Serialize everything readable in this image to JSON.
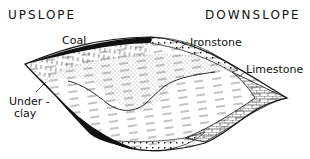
{
  "diagram": {
    "headings": {
      "upslope": "UPSLOPE",
      "downslope": "DOWNSLOPE"
    },
    "labels": {
      "coal": "Coal",
      "ironstone": "Ironstone",
      "limestone": "Limestone",
      "underclay_line1": "Under -",
      "underclay_line2": "clay"
    },
    "layers": [
      {
        "name": "coal",
        "pattern": "solid-black"
      },
      {
        "name": "ironstone",
        "pattern": "dots"
      },
      {
        "name": "limestone",
        "pattern": "brick"
      },
      {
        "name": "underclay",
        "pattern": "vertical-dashes"
      },
      {
        "name": "sandstone-fill",
        "pattern": "fine-stipple"
      },
      {
        "name": "shale-fill",
        "pattern": "dashed-lines"
      }
    ],
    "colors": {
      "ink": "#111111",
      "background": "#ffffff"
    }
  }
}
